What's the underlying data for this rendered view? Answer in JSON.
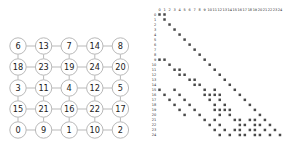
{
  "graph": {
    "title": "",
    "rows": 5,
    "cols": 5,
    "node_grid": [
      [
        6,
        13,
        7,
        14,
        8
      ],
      [
        18,
        23,
        19,
        24,
        20
      ],
      [
        3,
        11,
        4,
        12,
        5
      ],
      [
        15,
        21,
        16,
        22,
        17
      ],
      [
        0,
        9,
        1,
        10,
        2
      ]
    ],
    "node_fill": "#ffffff",
    "node_stroke": "#b9b9b9",
    "edge_color": "#b9b9b9",
    "label_color": "#1a1a1a"
  },
  "matrix": {
    "type": "spy",
    "size": 25,
    "col_headers": [
      "0",
      "1",
      "2",
      "3",
      "4",
      "5",
      "6",
      "7",
      "8",
      "9",
      "10",
      "11",
      "12",
      "13",
      "14",
      "15",
      "16",
      "17",
      "18",
      "19",
      "20",
      "21",
      "22",
      "23",
      "24"
    ],
    "row_headers": [
      "0",
      "1",
      "2",
      "3",
      "4",
      "5",
      "6",
      "7",
      "8",
      "9",
      "10",
      "11",
      "12",
      "13",
      "14",
      "15",
      "16",
      "17",
      "18",
      "19",
      "20",
      "21",
      "22",
      "23",
      "24"
    ],
    "marker_color": "#4a4a4a",
    "header_color": "#2b2b2b",
    "nonzeros": [
      [
        0,
        0
      ],
      [
        0,
        1
      ],
      [
        1,
        1
      ],
      [
        2,
        2
      ],
      [
        3,
        3
      ],
      [
        4,
        4
      ],
      [
        5,
        5
      ],
      [
        6,
        6
      ],
      [
        7,
        7
      ],
      [
        8,
        8
      ],
      [
        9,
        0
      ],
      [
        9,
        1
      ],
      [
        9,
        9
      ],
      [
        10,
        2
      ],
      [
        10,
        10
      ],
      [
        11,
        3
      ],
      [
        11,
        4
      ],
      [
        11,
        11
      ],
      [
        12,
        4
      ],
      [
        12,
        5
      ],
      [
        12,
        12
      ],
      [
        13,
        6
      ],
      [
        13,
        7
      ],
      [
        13,
        13
      ],
      [
        14,
        7
      ],
      [
        14,
        8
      ],
      [
        14,
        14
      ],
      [
        15,
        0
      ],
      [
        15,
        3
      ],
      [
        15,
        9
      ],
      [
        15,
        11
      ],
      [
        15,
        15
      ],
      [
        16,
        1
      ],
      [
        16,
        4
      ],
      [
        16,
        9
      ],
      [
        16,
        10
      ],
      [
        16,
        11
      ],
      [
        16,
        12
      ],
      [
        16,
        16
      ],
      [
        17,
        2
      ],
      [
        17,
        5
      ],
      [
        17,
        10
      ],
      [
        17,
        12
      ],
      [
        17,
        17
      ],
      [
        18,
        3
      ],
      [
        18,
        6
      ],
      [
        18,
        11
      ],
      [
        18,
        13
      ],
      [
        18,
        18
      ],
      [
        19,
        4
      ],
      [
        19,
        7
      ],
      [
        19,
        11
      ],
      [
        19,
        12
      ],
      [
        19,
        13
      ],
      [
        19,
        14
      ],
      [
        19,
        19
      ],
      [
        20,
        5
      ],
      [
        20,
        8
      ],
      [
        20,
        12
      ],
      [
        20,
        14
      ],
      [
        20,
        20
      ],
      [
        21,
        9
      ],
      [
        21,
        11
      ],
      [
        21,
        15
      ],
      [
        21,
        16
      ],
      [
        21,
        18
      ],
      [
        21,
        19
      ],
      [
        21,
        21
      ],
      [
        22,
        10
      ],
      [
        22,
        12
      ],
      [
        22,
        16
      ],
      [
        22,
        17
      ],
      [
        22,
        19
      ],
      [
        22,
        20
      ],
      [
        22,
        22
      ],
      [
        23,
        11
      ],
      [
        23,
        13
      ],
      [
        23,
        15
      ],
      [
        23,
        16
      ],
      [
        23,
        18
      ],
      [
        23,
        19
      ],
      [
        23,
        21
      ],
      [
        23,
        23
      ],
      [
        24,
        12
      ],
      [
        24,
        14
      ],
      [
        24,
        16
      ],
      [
        24,
        17
      ],
      [
        24,
        19
      ],
      [
        24,
        20
      ],
      [
        24,
        22
      ],
      [
        24,
        24
      ]
    ]
  }
}
